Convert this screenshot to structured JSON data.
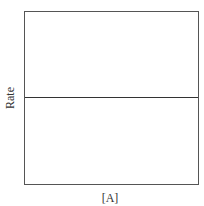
{
  "chart_data": {
    "type": "line",
    "title": "",
    "xlabel": "[A]",
    "ylabel": "Rate",
    "x": [
      0,
      1
    ],
    "series": [
      {
        "name": "Rate vs [A] (zero order)",
        "values": [
          0.5,
          0.5
        ]
      }
    ],
    "xlim": [
      0,
      1
    ],
    "ylim": [
      0,
      1
    ],
    "grid": false,
    "legend": "none",
    "colors": {
      "line": "#333333",
      "axes": "#555555"
    }
  }
}
